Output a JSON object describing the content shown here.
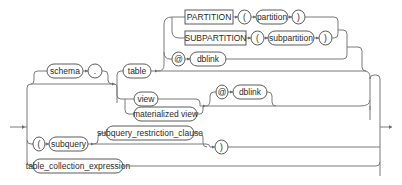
{
  "diagram": {
    "type": "railroad-syntax-diagram",
    "nodes": {
      "schema": "schema",
      "dot": ".",
      "table": "table",
      "partition_kw": "PARTITION",
      "partition_lparen": "(",
      "partition": "partition",
      "partition_rparen": ")",
      "subpartition_kw": "SUBPARTITION",
      "subpartition_lparen": "(",
      "subpartition": "subpartition",
      "subpartition_rparen": ")",
      "table_at": "@",
      "table_dblink": "dblink",
      "view": "view",
      "materialized_view": "materialized view",
      "view_at": "@",
      "view_dblink": "dblink",
      "subquery_lparen": "(",
      "subquery": "subquery",
      "subquery_restriction_clause": "subquery_restriction_clause",
      "subquery_rparen": ")",
      "table_collection_expression": "table_collection_expression"
    }
  }
}
